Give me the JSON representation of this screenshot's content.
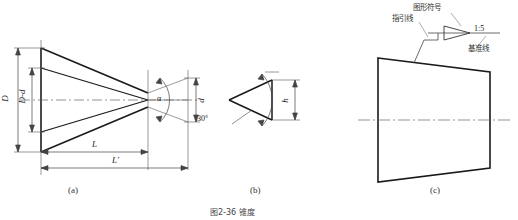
{
  "figure": {
    "caption": "图2-36 锥度",
    "subfigures": [
      {
        "id": "a",
        "label": "(a)"
      },
      {
        "id": "b",
        "label": "(b)"
      },
      {
        "id": "c",
        "label": "(c)"
      }
    ]
  },
  "diagram_a": {
    "dim_D": "D",
    "dim_D_minus_d": "D-d",
    "dim_d": "d",
    "dim_L": "L",
    "dim_L_prime": "L'",
    "angle_alpha": "α"
  },
  "diagram_b": {
    "angle": "30°",
    "dim_h": "h"
  },
  "diagram_c": {
    "label_symbol": "图形符号",
    "label_leader": "指引线",
    "label_datum": "基准线",
    "ratio": "1:5"
  },
  "colors": {
    "outline": "#1a1a1a",
    "thin": "#555555",
    "center": "#666666",
    "text": "#222222"
  }
}
